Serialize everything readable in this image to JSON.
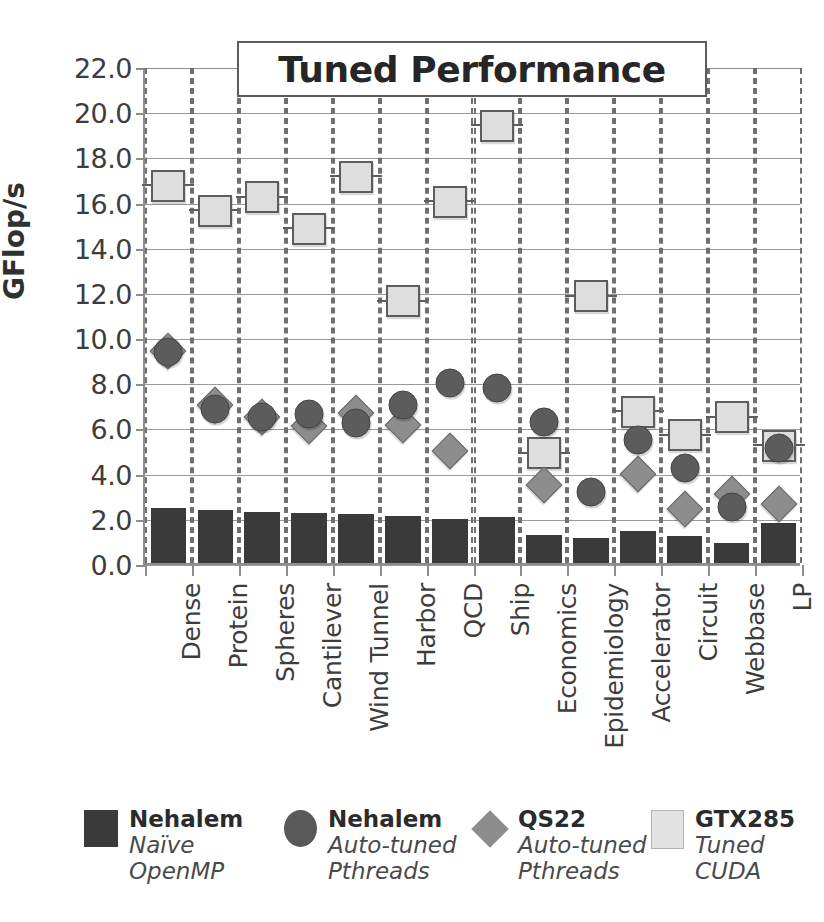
{
  "chart_data": {
    "type": "bar",
    "title": "Tuned Performance",
    "xlabel": "",
    "ylabel": "GFlop/s",
    "ylim": [
      0,
      22
    ],
    "ytick_step": 2,
    "grid": true,
    "legend_position": "bottom",
    "yticks": [
      "22.0",
      "20.0",
      "18.0",
      "16.0",
      "14.0",
      "12.0",
      "10.0",
      "8.0",
      "6.0",
      "4.0",
      "2.0",
      "0.0"
    ],
    "categories": [
      "Dense",
      "Protein",
      "Spheres",
      "Cantilever",
      "Wind Tunnel",
      "Harbor",
      "QCD",
      "Ship",
      "Economics",
      "Epidemiology",
      "Accelerator",
      "Circuit",
      "Webbase",
      "LP"
    ],
    "series": [
      {
        "name": "Nehalem",
        "sublabel": "Naïve OpenMP",
        "marker": "bar",
        "color": "#3a3a3a",
        "values": [
          2.45,
          2.35,
          2.28,
          2.2,
          2.15,
          2.1,
          1.95,
          2.05,
          1.25,
          1.1,
          1.4,
          1.2,
          0.9,
          1.75
        ]
      },
      {
        "name": "Nehalem",
        "sublabel": "Auto-tuned Pthreads",
        "marker": "circle",
        "color": "#5c5c5c",
        "values": [
          9.35,
          6.8,
          6.45,
          6.6,
          6.2,
          7.0,
          7.95,
          7.75,
          6.25,
          3.15,
          5.45,
          4.2,
          2.5,
          5.1
        ]
      },
      {
        "name": "QS22",
        "sublabel": "Auto-tuned Pthreads",
        "marker": "diamond",
        "color": "#8d8d8d",
        "values": [
          9.4,
          7.0,
          6.45,
          6.05,
          6.65,
          6.1,
          4.95,
          null,
          3.45,
          null,
          3.95,
          2.4,
          3.05,
          2.6
        ]
      },
      {
        "name": "GTX285",
        "sublabel": "Tuned CUDA",
        "marker": "square",
        "color": "#dedede",
        "values": [
          16.7,
          15.6,
          16.2,
          14.8,
          17.1,
          11.6,
          16.0,
          19.35,
          4.85,
          11.8,
          6.7,
          5.65,
          6.45,
          5.2
        ]
      }
    ]
  },
  "legend": {
    "items": [
      {
        "swatch": "square-dark",
        "title": "Nehalem",
        "line1": "Naïve",
        "line2": "OpenMP"
      },
      {
        "swatch": "circle",
        "title": "Nehalem",
        "line1": "Auto-tuned",
        "line2": "Pthreads"
      },
      {
        "swatch": "diamond",
        "title": "QS22",
        "line1": "Auto-tuned",
        "line2": "Pthreads"
      },
      {
        "swatch": "square-light",
        "title": "GTX285",
        "line1": "Tuned",
        "line2": "CUDA"
      }
    ]
  },
  "colors": {
    "bar": "#3a3a3a",
    "circle": "#5c5c5c",
    "diamond": "#8d8d8d",
    "square": "#dedede",
    "axis": "#8d8d8d",
    "grid": "#9a9a9a",
    "dash": "#6f6f6f"
  }
}
